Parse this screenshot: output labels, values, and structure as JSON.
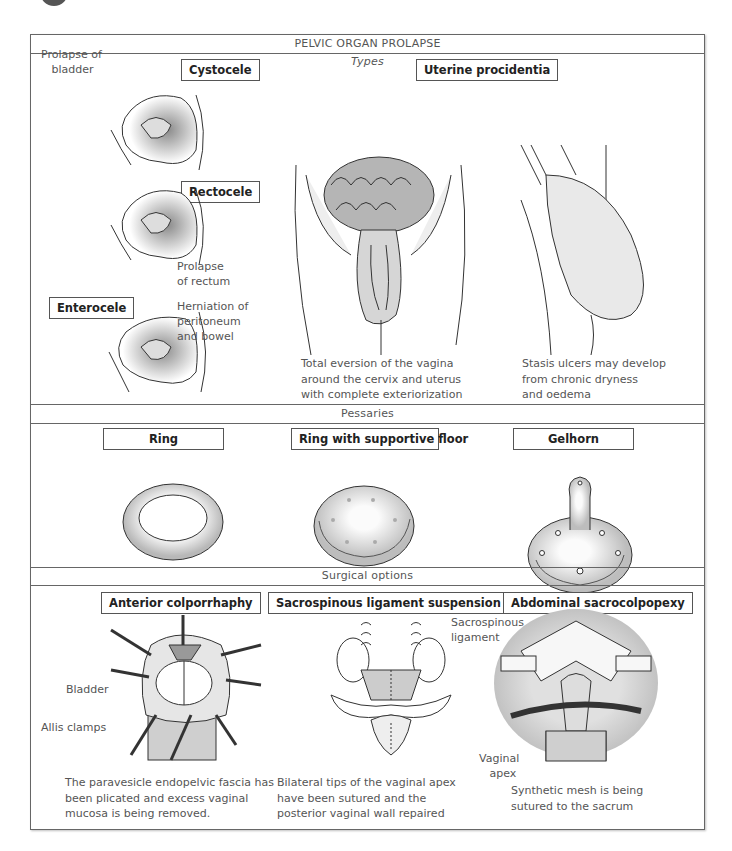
{
  "title": "PELVIC ORGAN PROLAPSE",
  "sections": {
    "types": {
      "header": "Types",
      "items": [
        {
          "label": "Cystocele",
          "annotation": "Prolapse of\n   bladder"
        },
        {
          "label": "Rectocele",
          "annotation": "Prolapse\nof rectum"
        },
        {
          "label": "Enterocele",
          "annotation": "Herniation of\nperitoneum\nand bowel"
        }
      ],
      "procidentia": {
        "label": "Uterine procidentia",
        "caption_left": "Total eversion of the vagina\naround the cervix and uterus\nwith complete exteriorization",
        "caption_right": "Stasis ulcers may develop\nfrom chronic dryness\nand oedema"
      }
    },
    "pessaries": {
      "header": "Pessaries",
      "items": [
        {
          "label": "Ring"
        },
        {
          "label": "Ring with supportive floor"
        },
        {
          "label": "Gelhorn"
        }
      ]
    },
    "surgical": {
      "header": "Surgical options",
      "items": [
        {
          "label": "Anterior colporrhaphy",
          "annotations": [
            "Bladder",
            "Allis clamps"
          ],
          "caption": "The paravesicle endopelvic fascia has\nbeen plicated and excess vaginal\nmucosa is being removed."
        },
        {
          "label": "Sacrospinous ligament suspension",
          "annotations": [
            "Sacrospinous\nligament"
          ],
          "caption": "Bilateral tips of the vaginal apex\nhave been sutured and the\nposterior vaginal wall repaired"
        },
        {
          "label": "Abdominal sacrocolpopexy",
          "annotations": [
            "Vaginal\n   apex"
          ],
          "caption": "Synthetic mesh is being\nsutured to the sacrum"
        }
      ]
    }
  },
  "colors": {
    "frame": "#666666",
    "text": "#555555",
    "label_text": "#222222",
    "shading": "#c8c8c8"
  }
}
